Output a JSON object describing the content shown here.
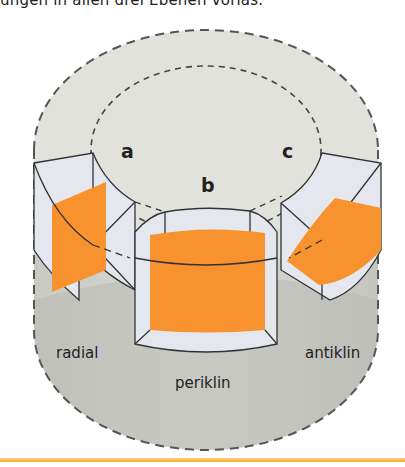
{
  "caption": {
    "text": "ungen in allen drei Ebenen vorlas."
  },
  "figure": {
    "sections": [
      {
        "id": "a",
        "label": "a",
        "plane": "radial"
      },
      {
        "id": "b",
        "label": "b",
        "plane": "periklin"
      },
      {
        "id": "c",
        "label": "c",
        "plane": "antiklin"
      }
    ],
    "plane_labels": {
      "radial": "radial",
      "periklin": "periklin",
      "antiklin": "antiklin"
    },
    "colors": {
      "cut_plane": "#f7922e",
      "block_face": "#e4e8ee",
      "cylinder": "#d8d8d2",
      "shadow": "#a9a9a6",
      "outline": "#333333",
      "accent_rule": "#f5a623"
    }
  }
}
